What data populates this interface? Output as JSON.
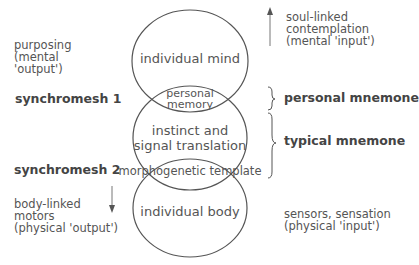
{
  "left": {
    "purposing": [
      "purposing",
      "(mental",
      "'output')"
    ],
    "synchromesh1": "synchromesh 1",
    "synchromesh2": "synchromesh 2",
    "body_linked": [
      "body-linked",
      "motors",
      "(physical 'output')"
    ]
  },
  "center": {
    "individual_mind": "individual mind",
    "personal_memory": [
      "personal",
      "memory"
    ],
    "instinct": [
      "instinct and",
      "signal translation"
    ],
    "morphogenetic": "morphogenetic template",
    "individual_body": "individual body"
  },
  "right": {
    "soul_linked": [
      "soul-linked",
      "contemplation",
      "(mental 'input')"
    ],
    "personal_mnemone": "personal mnemone",
    "typical_mnemone": "typical mnemone",
    "sensors": [
      "sensors, sensation",
      "(physical 'input')"
    ]
  },
  "icons": {
    "up_arrow": "arrow-up",
    "down_arrow": "arrow-down",
    "brace_small": "curly-brace-right",
    "brace_large": "curly-brace-right"
  },
  "colors": {
    "line": "#555555",
    "text": "#555555",
    "background": "#ffffff"
  }
}
